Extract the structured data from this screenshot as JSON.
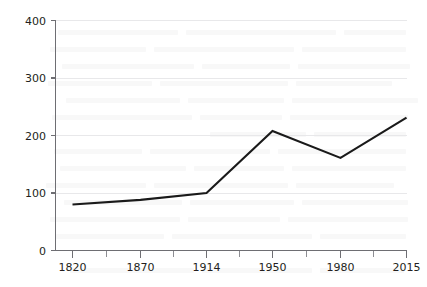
{
  "chart_data": {
    "type": "line",
    "title": "",
    "subtitle": "",
    "xlabel": "",
    "ylabel": "",
    "x": [
      1820,
      1870,
      1914,
      1950,
      1980,
      2015
    ],
    "categories": [
      "1820",
      "1870",
      "1914",
      "1950",
      "1980",
      "2015"
    ],
    "values": [
      80,
      88,
      100,
      208,
      161,
      231
    ],
    "series": [
      {
        "name": "",
        "values": [
          80,
          88,
          100,
          208,
          161,
          231
        ]
      }
    ],
    "xlim": [
      1800,
      2030
    ],
    "ylim": [
      0,
      400
    ],
    "ytick_labels": [
      "0",
      "100",
      "200",
      "300",
      "400"
    ],
    "ytick_values": [
      0,
      100,
      200,
      300,
      400
    ],
    "xtick_labels": [
      "1820",
      "1870",
      "1914",
      "1950",
      "1980",
      "2015"
    ],
    "xtick_values": [
      1820,
      1870,
      1914,
      1950,
      1980,
      2015
    ],
    "grid": "horizontal",
    "legend": "none",
    "line_color": "#1a1a1a",
    "grid_color": "#e8e8ea",
    "axis_color": "#6e6e73",
    "background_color": "#ffffff",
    "annotations": []
  },
  "axes": {
    "y": {
      "ticks": [
        {
          "label": "400",
          "value": 400
        },
        {
          "label": "300",
          "value": 300
        },
        {
          "label": "200",
          "value": 200
        },
        {
          "label": "100",
          "value": 100
        },
        {
          "label": "0",
          "value": 0
        }
      ]
    },
    "x": {
      "ticks": [
        {
          "label": "1820",
          "value": 1820
        },
        {
          "label": "1870",
          "value": 1870
        },
        {
          "label": "1914",
          "value": 1914
        },
        {
          "label": "1950",
          "value": 1950
        },
        {
          "label": "1980",
          "value": 1980
        },
        {
          "label": "2015",
          "value": 2015
        }
      ]
    }
  }
}
